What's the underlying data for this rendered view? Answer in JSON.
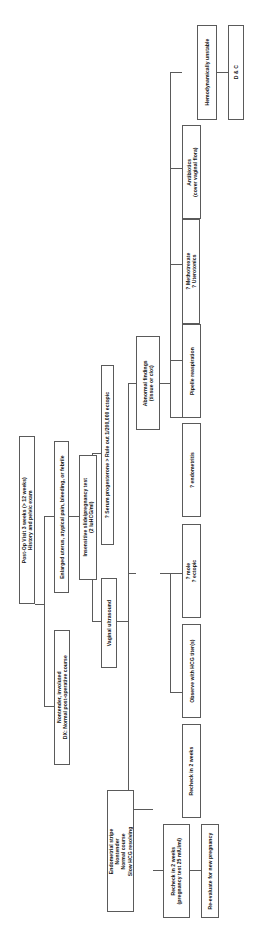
{
  "diagram": {
    "orientation": "rotated-90",
    "type": "flowchart",
    "line_color": "#5a5a5a",
    "box_fill": "#ffffff",
    "text_color": "#111111",
    "nodes": [
      {
        "id": "post-op-visit",
        "lines": [
          "Post-Op Visit 3 weeks (> 12 weeks)",
          "History and pelvic exam"
        ]
      },
      {
        "id": "enlarged-uterus",
        "lines": [
          "Enlarged uterus, atypical pain, bleeding, or febrile"
        ]
      },
      {
        "id": "dx-normal",
        "lines": [
          "Nontender, involuted",
          "DX:  Normal post-operative course"
        ]
      },
      {
        "id": "insensitive-slide",
        "lines": [
          "Insensitive slide/pregnancy test",
          "(2 IuHCG/ml)"
        ]
      },
      {
        "id": "vaginal-ultrasound",
        "lines": [
          "Vaginal ultrasound"
        ]
      },
      {
        "id": "serum-progesterone",
        "lines": [
          "? Serum progesterone > Rule out 1/200,000 ectopic"
        ]
      },
      {
        "id": "abnormal-findings",
        "lines": [
          "Abnormal findings",
          "(tissue or clot)"
        ]
      },
      {
        "id": "endometrial-stripe",
        "lines": [
          "Endometrial stripe",
          "Nontender",
          "Normal course",
          "Slow HCG resolving"
        ]
      },
      {
        "id": "methotrexate",
        "lines": [
          "? Methotrexate",
          "? Uterotonics"
        ]
      },
      {
        "id": "antibiotics",
        "lines": [
          "Antibiotics",
          "(cover vaginal flora)"
        ]
      },
      {
        "id": "hemodynamically-unstable",
        "lines": [
          "Hemodynamically unstable"
        ]
      },
      {
        "id": "dandc",
        "lines": [
          "D & C"
        ]
      },
      {
        "id": "pipelle-reaspiration",
        "lines": [
          "Pipelle reaspiration"
        ]
      },
      {
        "id": "endometritis",
        "lines": [
          "? endometritis"
        ]
      },
      {
        "id": "mole-ectopic",
        "lines": [
          "? mole",
          "? ectopic"
        ]
      },
      {
        "id": "observe-hcg",
        "lines": [
          "Observe with HCG titer(s)"
        ]
      },
      {
        "id": "recheck-2-weeks",
        "lines": [
          "Recheck in 2 weeks"
        ]
      },
      {
        "id": "recheck-2-weeks-preg",
        "lines": [
          "Recheck in 2 weeks",
          "(pregnancy test 25 mIU/ml)"
        ]
      },
      {
        "id": "re-evaluate",
        "lines": [
          "Re-evaluate for new pregnancy"
        ]
      }
    ]
  }
}
